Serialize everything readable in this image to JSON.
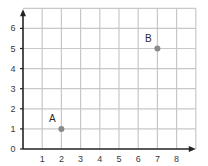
{
  "chart_data": {
    "type": "scatter",
    "title": "",
    "xlabel": "",
    "ylabel": "",
    "xlim": [
      0,
      9
    ],
    "ylim": [
      0,
      7
    ],
    "grid": true,
    "x_ticks": [
      1,
      2,
      3,
      4,
      5,
      6,
      7,
      8
    ],
    "y_ticks": [
      0,
      1,
      2,
      3,
      4,
      5,
      6
    ],
    "points": [
      {
        "label": "A",
        "x": 2,
        "y": 1
      },
      {
        "label": "B",
        "x": 7,
        "y": 5
      }
    ]
  },
  "colors": {
    "grid": "#c8c8c8",
    "axis": "#222222",
    "point": "#8a8a8a"
  }
}
